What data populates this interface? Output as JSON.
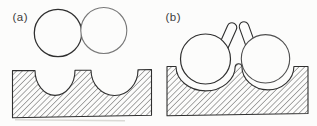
{
  "figure": {
    "background_color": "#fcfcfb",
    "ink_color": "#2f2f2f",
    "hatch_color": "#4b4b4b",
    "panels": [
      {
        "label": "(a)"
      },
      {
        "label": "(b)"
      }
    ]
  }
}
